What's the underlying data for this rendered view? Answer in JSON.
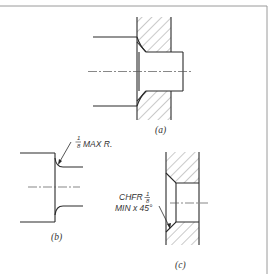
{
  "figure": {
    "views": [
      {
        "id": "a",
        "label": "(a)"
      },
      {
        "id": "b",
        "label": "(b)"
      },
      {
        "id": "c",
        "label": "(c)"
      }
    ],
    "annotations": {
      "fillet_note": {
        "fraction_num": "1",
        "fraction_den": "8",
        "text": "MAX R."
      },
      "chamfer_note": {
        "line1_text": "CHFR",
        "fraction_num": "1",
        "fraction_den": "8",
        "line2_text": "MIN x 45°"
      }
    },
    "colors": {
      "line": "#2a2a2a",
      "hatch": "#666666",
      "frame": "#9a9a9a",
      "background": "#ffffff"
    }
  }
}
